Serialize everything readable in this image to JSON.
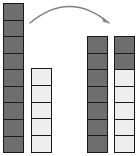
{
  "canvas": {
    "width": 140,
    "height": 156,
    "background": "#ffffff"
  },
  "colors": {
    "filled_cell": "#6e6e6e",
    "empty_cell": "#eeeeee",
    "cell_border": "#1a1a1a",
    "arrow": "#808080"
  },
  "diagram": {
    "type": "two-column-transfer",
    "columns": [
      {
        "id": "source-tall-column",
        "label": "left tall column",
        "x": 3,
        "y": 3,
        "width": 21,
        "height": 150,
        "total_cells": 9,
        "filled_cells": 9,
        "empty_cells": 0,
        "cells": [
          "dark",
          "dark",
          "dark",
          "dark",
          "dark",
          "dark",
          "dark",
          "dark",
          "dark"
        ]
      },
      {
        "id": "source-short-column",
        "label": "left short column",
        "x": 31,
        "y": 68,
        "width": 21,
        "height": 85,
        "total_cells": 5,
        "filled_cells": 0,
        "empty_cells": 5,
        "cells": [
          "light",
          "light",
          "light",
          "light",
          "light"
        ]
      },
      {
        "id": "result-tall-column",
        "label": "right tall column",
        "x": 87,
        "y": 36,
        "width": 21,
        "height": 117,
        "total_cells": 7,
        "filled_cells": 7,
        "empty_cells": 0,
        "cells": [
          "dark",
          "dark",
          "dark",
          "dark",
          "dark",
          "dark",
          "dark"
        ]
      },
      {
        "id": "result-short-column",
        "label": "right short column",
        "x": 114,
        "y": 36,
        "width": 21,
        "height": 117,
        "total_cells": 7,
        "filled_cells": 2,
        "empty_cells": 5,
        "cells": [
          "dark",
          "dark",
          "light",
          "light",
          "light",
          "light",
          "light"
        ]
      }
    ],
    "arrow": {
      "id": "transfer-arrow",
      "from_x": 30,
      "from_y": 23,
      "to_x": 109,
      "to_y": 23,
      "curve_peak_y": 4,
      "direction": "right",
      "stroke": "#808080",
      "stroke_width": 1.4
    }
  }
}
